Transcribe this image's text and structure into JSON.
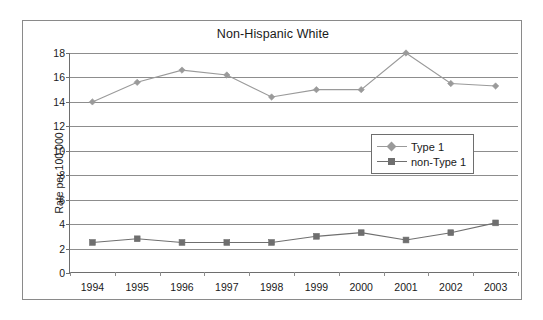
{
  "chart_data": {
    "type": "line",
    "title": "Non-Hispanic White",
    "xlabel": "",
    "ylabel": "Rate per 100,000",
    "x": [
      "1994",
      "1995",
      "1996",
      "1997",
      "1998",
      "1999",
      "2000",
      "2001",
      "2002",
      "2003"
    ],
    "categories": [
      "1994",
      "1995",
      "1996",
      "1997",
      "1998",
      "1999",
      "2000",
      "2001",
      "2002",
      "2003"
    ],
    "series": [
      {
        "name": "Type 1",
        "marker": "diamond",
        "color": "#9a9a9a",
        "values": [
          14.0,
          15.6,
          16.6,
          16.2,
          14.4,
          15.0,
          15.0,
          18.0,
          15.5,
          15.3
        ]
      },
      {
        "name": "non-Type 1",
        "marker": "square",
        "color": "#6f6f6f",
        "values": [
          2.5,
          2.8,
          2.5,
          2.5,
          2.5,
          3.0,
          3.3,
          2.7,
          3.3,
          4.1
        ]
      }
    ],
    "ylim": [
      0,
      18
    ],
    "yticks": [
      0,
      2,
      4,
      6,
      8,
      10,
      12,
      14,
      16,
      18
    ],
    "ytick_labels": [
      "0",
      "2",
      "4",
      "6",
      "8",
      "10",
      "12",
      "14",
      "16",
      "18"
    ],
    "grid": "horizontal",
    "legend_position": "center-right",
    "legend_entries": [
      "Type 1",
      "non-Type 1"
    ]
  },
  "legend": {
    "entries": [
      {
        "label": "Type 1"
      },
      {
        "label": "non-Type 1"
      }
    ]
  },
  "colors": {
    "series_type1": "#9a9a9a",
    "series_nontype1": "#6f6f6f",
    "gridline": "#8d8d8d",
    "axis": "#6e6e6e",
    "frame": "#8a8a8a",
    "text": "#1a1a1a",
    "background": "#ffffff"
  }
}
